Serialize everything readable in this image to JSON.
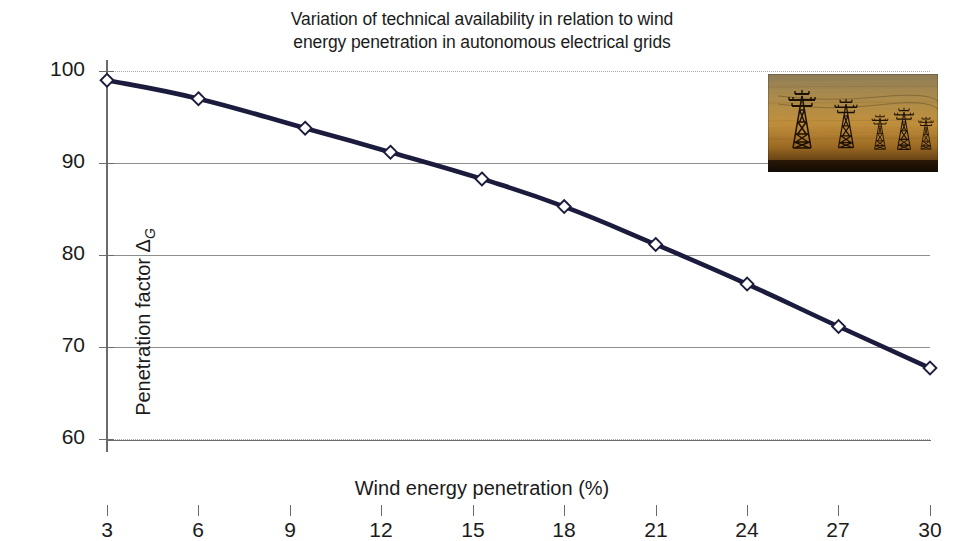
{
  "chart_data": {
    "type": "line",
    "title": "Variation of technical availability in relation to wind energy penetration in autonomous electrical grids",
    "title_lines": [
      "Variation of technical availability in relation to wind",
      "energy penetration in autonomous electrical grids"
    ],
    "xlabel": "Wind energy penetration (%)",
    "ylabel": "Penetration factor Δ",
    "ylabel_subscript": "G",
    "xlim": [
      3,
      30
    ],
    "ylim": [
      60,
      100
    ],
    "xticks": [
      3,
      6,
      9,
      12,
      15,
      18,
      21,
      24,
      27,
      30
    ],
    "xtick_labels": [
      "3",
      "6",
      "9",
      "12",
      "15",
      "18",
      "21",
      "24",
      "27",
      "30"
    ],
    "yticks": [
      60,
      70,
      80,
      90,
      100
    ],
    "ytick_labels": [
      "60",
      "70",
      "80",
      "90",
      "100"
    ],
    "grid": "horizontal",
    "legend": "none",
    "series": [
      {
        "name": "Penetration factor",
        "color": "#1b1b3d",
        "marker": "diamond",
        "marker_fill": "#ffffff",
        "x": [
          3,
          6,
          9.5,
          12.3,
          15.3,
          18,
          21,
          24,
          27,
          30
        ],
        "values": [
          99.0,
          97.0,
          93.8,
          91.2,
          88.3,
          85.3,
          81.2,
          76.9,
          72.3,
          67.8
        ]
      }
    ]
  },
  "inset": {
    "name": "transmission-towers-photo",
    "description": "Silhouetted electricity pylons against an amber sunset sky",
    "sky_color": "#b98a3c",
    "tower_color": "#241505"
  },
  "caption": {
    "text": ""
  }
}
